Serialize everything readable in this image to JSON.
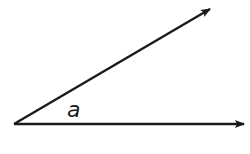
{
  "diagram": {
    "type": "angle",
    "angle_label": "a",
    "vertex": [
      14,
      124
    ],
    "rays": [
      {
        "name": "upper-ray",
        "end": [
          211,
          9
        ]
      },
      {
        "name": "lower-ray",
        "end": [
          245,
          124
        ]
      }
    ],
    "stroke_color": "#1a1a1a",
    "background": "#ffffff"
  }
}
